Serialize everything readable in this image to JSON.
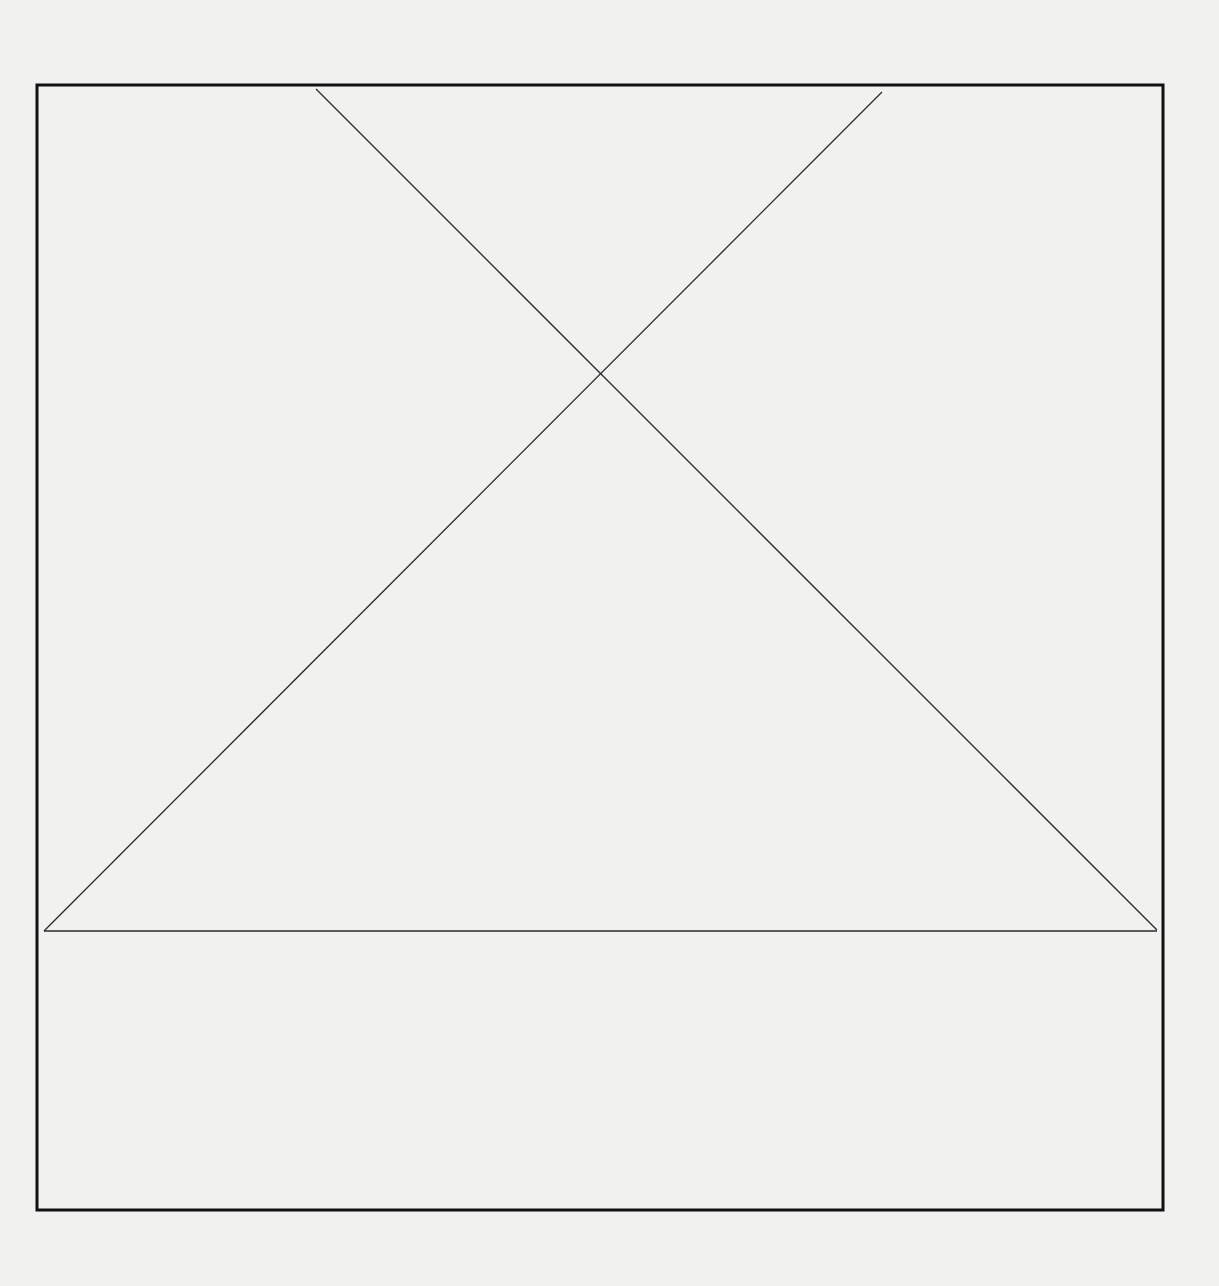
{
  "diagram": {
    "canvas": {
      "width": 1219,
      "height": 1286,
      "background": "#f1f1f0"
    },
    "frame": {
      "x": 37,
      "y": 85,
      "width": 1126,
      "height": 1125,
      "stroke": "#111111",
      "stroke_width": 3
    },
    "lines": [
      {
        "id": "diagonal-descending",
        "x1": 316,
        "y1": 89,
        "x2": 1157,
        "y2": 930,
        "stroke": "#2a2a2a",
        "stroke_width": 1.3
      },
      {
        "id": "diagonal-ascending",
        "x1": 882,
        "y1": 92,
        "x2": 44,
        "y2": 931,
        "stroke": "#2a2a2a",
        "stroke_width": 1.3
      },
      {
        "id": "base-line",
        "x1": 44,
        "y1": 931,
        "x2": 1157,
        "y2": 931,
        "stroke": "#2a2a2a",
        "stroke_width": 1.3
      }
    ],
    "intersection": {
      "x": 601,
      "y": 371
    }
  }
}
